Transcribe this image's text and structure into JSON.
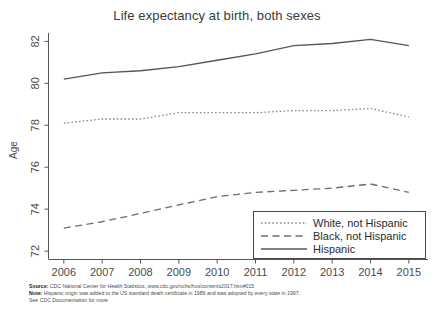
{
  "chart_data": {
    "type": "line",
    "title": "Life expectancy at birth, both sexes",
    "xlabel": "",
    "ylabel": "Age",
    "x": [
      2006,
      2007,
      2008,
      2009,
      2010,
      2011,
      2012,
      2013,
      2014,
      2015
    ],
    "xticklabels": [
      "2006",
      "2007",
      "2008",
      "2009",
      "2010",
      "2011",
      "2012",
      "2013",
      "2014",
      "2015"
    ],
    "yticklabels": [
      "72",
      "74",
      "76",
      "78",
      "80",
      "82"
    ],
    "ylim": [
      71.6,
      82.4
    ],
    "xlim": [
      2005.6,
      2015.5
    ],
    "grid": false,
    "legend_position": "lower right",
    "series": [
      {
        "name": "White, not Hispanic",
        "style": "dotted",
        "color": "#8a8a8a",
        "values": [
          78.1,
          78.3,
          78.3,
          78.6,
          78.6,
          78.6,
          78.7,
          78.7,
          78.8,
          78.4
        ]
      },
      {
        "name": "Black, not Hispanic",
        "style": "dashed",
        "color": "#6d6d6d",
        "values": [
          73.1,
          73.4,
          73.8,
          74.2,
          74.6,
          74.8,
          74.9,
          75.0,
          75.2,
          74.8
        ]
      },
      {
        "name": "Hispanic",
        "style": "solid",
        "color": "#555555",
        "values": [
          80.2,
          80.5,
          80.6,
          80.8,
          81.1,
          81.4,
          81.8,
          81.9,
          82.1,
          81.8
        ]
      }
    ]
  },
  "legend": {
    "items": [
      {
        "label": "White, not Hispanic",
        "style": "dotted"
      },
      {
        "label": "Black, not Hispanic",
        "style": "dashed"
      },
      {
        "label": "Hispanic",
        "style": "solid"
      }
    ]
  },
  "footnotes": {
    "source_label": "Source:",
    "source_text": " CDC National Center for Health Statistics, www.cdc.gov/nchs/hus/contents2017.htm#015",
    "note_label": "Note:",
    "note_text": " Hispanic origin was added to the US standard death certificate in 1989 and was adopted by every state in 1997.",
    "extra_text": "See CDC Documentation for more"
  }
}
